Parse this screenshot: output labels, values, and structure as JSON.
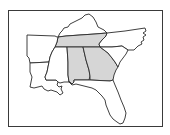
{
  "map": {
    "title": "Southeastern United States",
    "colors": {
      "highlight": "#d6d6d6",
      "default": "#ffffff",
      "border": "#2a2a2a",
      "frame": "#3a3a3a"
    },
    "states": [
      {
        "name": "Kentucky",
        "highlighted": false
      },
      {
        "name": "Tennessee",
        "highlighted": true
      },
      {
        "name": "North Carolina",
        "highlighted": false
      },
      {
        "name": "Arkansas",
        "highlighted": false
      },
      {
        "name": "Louisiana",
        "highlighted": false
      },
      {
        "name": "Mississippi",
        "highlighted": false
      },
      {
        "name": "Alabama",
        "highlighted": true
      },
      {
        "name": "Georgia",
        "highlighted": true
      },
      {
        "name": "South Carolina",
        "highlighted": false
      },
      {
        "name": "Florida",
        "highlighted": false
      }
    ],
    "highlighted_states": [
      "Tennessee",
      "Alabama",
      "Georgia"
    ]
  }
}
